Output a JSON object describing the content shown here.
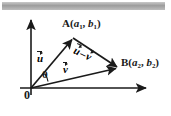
{
  "figure": {
    "type": "vector-diagram",
    "title_bar": {
      "present": true,
      "color": "#a8a8a8"
    },
    "background_color": "#ffffff",
    "ink_color": "#1a1a1a",
    "axes": {
      "origin_label": "0",
      "x_axis": {
        "from": [
          31,
          88
        ],
        "to": [
          148,
          88
        ],
        "arrow": "right"
      },
      "y_axis": {
        "from": [
          31,
          95
        ],
        "to": [
          31,
          18
        ],
        "arrow": "up"
      }
    },
    "points": [
      {
        "name": "O",
        "label": "0",
        "x": 31,
        "y": 88
      },
      {
        "name": "A",
        "label_prefix": "A",
        "label_open": "(",
        "sub_a": "a",
        "sub_a_index": "1",
        "sep": ", ",
        "sub_b": "b",
        "sub_b_index": "1",
        "label_close": ")",
        "x": 73,
        "y": 38
      },
      {
        "name": "B",
        "label_prefix": "B",
        "label_open": "(",
        "sub_a": "a",
        "sub_a_index": "2",
        "sep": ", ",
        "sub_b": "b",
        "sub_b_index": "2",
        "label_close": ")",
        "x": 118,
        "y": 68
      }
    ],
    "vectors": [
      {
        "name": "u",
        "glyph": "u",
        "overbar_arrow": true,
        "from": [
          31,
          88
        ],
        "to": [
          73,
          38
        ],
        "label_x": 37,
        "label_y": 52
      },
      {
        "name": "v",
        "glyph": "v",
        "overbar_arrow": true,
        "from": [
          31,
          88
        ],
        "to": [
          118,
          68
        ],
        "label_x": 63,
        "label_y": 63
      },
      {
        "name": "u-minus-v",
        "glyph_first": "u",
        "operator": "–",
        "glyph_second": "v",
        "overbar_arrow": true,
        "from": [
          73,
          38
        ],
        "to": [
          118,
          68
        ],
        "label_x": 77,
        "label_y": 44,
        "rotation_deg": 25
      }
    ],
    "angle": {
      "name": "theta",
      "symbol": "θ",
      "at": [
        31,
        88
      ],
      "label_x": 42,
      "label_y": 69
    }
  }
}
